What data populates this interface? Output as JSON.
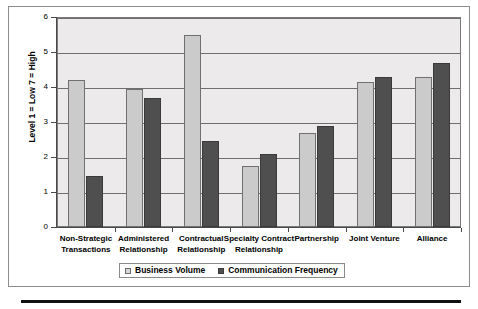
{
  "chart_data": {
    "type": "bar",
    "title": "",
    "subtitle": "",
    "xlabel": "",
    "ylabel": "Level 1 = Low 7 = High",
    "ylim": [
      0,
      6
    ],
    "yticks": [
      0,
      1,
      2,
      3,
      4,
      5,
      6
    ],
    "ytick_labels": [
      "0",
      "1",
      "2",
      "3",
      "4",
      "5",
      "6"
    ],
    "grid": true,
    "legend_position": "bottom",
    "categories": [
      "Non-Strategic Transactions",
      "Administered Relationship",
      "Contractual Relationship",
      "Specialty Contract Relationship",
      "Partnership",
      "Joint Venture",
      "Alliance"
    ],
    "category_lines": [
      [
        "Non-Strategic",
        "Transactions"
      ],
      [
        "Administered",
        "Relationship"
      ],
      [
        "Contractual",
        "Relationship"
      ],
      [
        "Specialty Contract",
        "Relationship"
      ],
      [
        "Partnership"
      ],
      [
        "Joint Venture"
      ],
      [
        "Alliance"
      ]
    ],
    "series": [
      {
        "name": "Business Volume",
        "color": "#cbcbcb",
        "values": [
          4.2,
          3.95,
          5.5,
          1.75,
          2.7,
          4.15,
          4.3
        ]
      },
      {
        "name": "Communication Frequency",
        "color": "#4f4f4f",
        "values": [
          1.45,
          3.7,
          2.45,
          2.1,
          2.9,
          4.3,
          4.7
        ]
      }
    ]
  },
  "legend": {
    "items": [
      {
        "label": "Business Volume",
        "swatch": "legend-swatch-business-volume"
      },
      {
        "label": "Communication Frequency",
        "swatch": "legend-swatch-communication-frequency"
      }
    ]
  },
  "colors": {
    "series_light": "#cbcbcb",
    "series_dark": "#4f4f4f",
    "plot_background": "#eceaea",
    "gridline": "#6f6f6f",
    "axis": "#4a4a4a",
    "frame": "#8d8d8d",
    "rule": "#111111"
  }
}
